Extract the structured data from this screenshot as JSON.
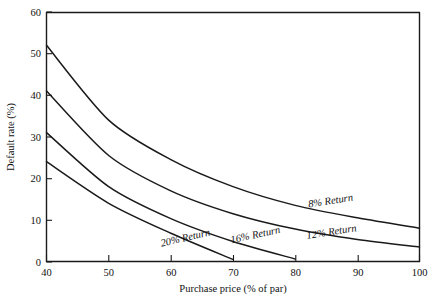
{
  "chart_data": {
    "type": "line",
    "title": "",
    "xlabel": "Purchase price (% of par)",
    "ylabel": "Default rate (%)",
    "xlim": [
      40,
      100
    ],
    "ylim": [
      0,
      60
    ],
    "xticks": [
      40,
      50,
      60,
      70,
      80,
      90,
      100
    ],
    "yticks": [
      0,
      10,
      20,
      30,
      40,
      50,
      60
    ],
    "grid": false,
    "legend_position": "inline-on-curve",
    "series": [
      {
        "name": "8% Return",
        "label": "8% Return",
        "x": [
          40,
          50,
          60,
          70,
          80,
          90,
          100
        ],
        "values": [
          52.0,
          34.0,
          24.5,
          18.0,
          13.5,
          10.5,
          8.0
        ]
      },
      {
        "name": "12% Return",
        "label": "12% Return",
        "x": [
          40,
          50,
          60,
          70,
          80,
          90,
          100
        ],
        "values": [
          41.0,
          25.5,
          17.0,
          11.5,
          7.8,
          5.3,
          3.5
        ]
      },
      {
        "name": "16% Return",
        "label": "16% Return",
        "x": [
          40,
          50,
          60,
          70,
          80
        ],
        "values": [
          31.0,
          18.0,
          10.3,
          4.8,
          0.6
        ]
      },
      {
        "name": "20% Return",
        "label": "20% Return",
        "x": [
          40,
          50,
          60,
          70
        ],
        "values": [
          24.0,
          14.0,
          6.8,
          0.5
        ]
      }
    ],
    "colors": {
      "line": "#1a1a1a",
      "axis": "#1a1a1a",
      "background": "#ffffff"
    }
  },
  "labels": {
    "x_ticks": [
      "40",
      "50",
      "60",
      "70",
      "80",
      "90",
      "100"
    ],
    "y_ticks": [
      "0",
      "10",
      "20",
      "30",
      "40",
      "50",
      "60"
    ],
    "series_8": "8% Return",
    "series_12": "12% Return",
    "series_16": "16% Return",
    "series_20": "20% Return",
    "x_title": "Purchase price (% of par)",
    "y_title": "Default rate (%)"
  }
}
